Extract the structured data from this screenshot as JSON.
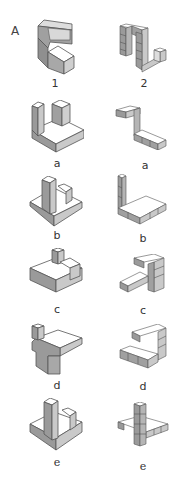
{
  "panel": {
    "label": "A"
  },
  "colors": {
    "top": "#ffffff",
    "left": "#9a9a9a",
    "right": "#c9c9c9",
    "edge": "#555555"
  },
  "columns": [
    {
      "name": "solid-shapes",
      "items": [
        {
          "label": "1"
        },
        {
          "label": "a"
        },
        {
          "label": "b"
        },
        {
          "label": "c"
        },
        {
          "label": "d"
        },
        {
          "label": "e"
        }
      ]
    },
    {
      "name": "cube-shapes",
      "items": [
        {
          "label": "2"
        },
        {
          "label": "a"
        },
        {
          "label": "b"
        },
        {
          "label": "c"
        },
        {
          "label": "d"
        },
        {
          "label": "e"
        }
      ]
    }
  ]
}
